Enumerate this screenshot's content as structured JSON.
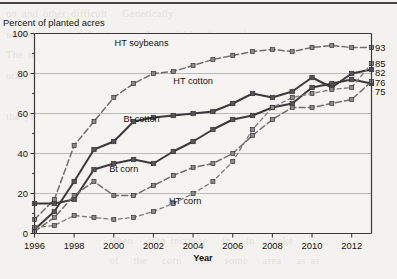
{
  "page": {
    "header_note": "Percent of planted acres"
  },
  "chart_data": {
    "type": "line",
    "title": "Percent of planted acres",
    "xlabel": "Year",
    "ylabel": "Percent of planted acres",
    "xlim": [
      1996,
      2013
    ],
    "ylim": [
      0,
      100
    ],
    "xticks": [
      1996,
      1998,
      2000,
      2002,
      2004,
      2006,
      2008,
      2010,
      2012
    ],
    "xtick_labels": [
      "1996",
      "1998",
      "2000",
      "2002",
      "2004",
      "2006",
      "2008",
      "2010",
      "2012"
    ],
    "yticks": [
      0,
      20,
      40,
      60,
      80,
      100
    ],
    "ytick_labels": [
      "0",
      "20",
      "40",
      "60",
      "80",
      "100"
    ],
    "yminor_ticks": [
      10,
      30,
      50,
      70,
      90
    ],
    "grid": "horizontal",
    "legend_position": "inline-annotations",
    "x": [
      1996,
      1997,
      1998,
      1999,
      2000,
      2001,
      2002,
      2003,
      2004,
      2005,
      2006,
      2007,
      2008,
      2009,
      2010,
      2011,
      2012,
      2013
    ],
    "series": [
      {
        "name": "HT soybeans",
        "label": "HT soybeans",
        "end_label": "93",
        "end_value": 93,
        "style": "dashed",
        "values": [
          7,
          17,
          44,
          56,
          68,
          75,
          80,
          81,
          84,
          87,
          89,
          91,
          92,
          91,
          93,
          94,
          93,
          93
        ]
      },
      {
        "name": "HT cotton",
        "label": "HT cotton",
        "end_label": "82",
        "end_value": 82,
        "style": "solid",
        "values": [
          2,
          11,
          26,
          42,
          46,
          56,
          58,
          59,
          60,
          61,
          65,
          70,
          68,
          71,
          78,
          73,
          80,
          82
        ]
      },
      {
        "name": "Bt cotton",
        "label": "Bt cotton",
        "end_label": "75",
        "end_value": 75,
        "style": "solid",
        "values": [
          15,
          15,
          17,
          32,
          35,
          37,
          35,
          41,
          46,
          52,
          57,
          59,
          63,
          65,
          73,
          75,
          77,
          75
        ]
      },
      {
        "name": "Bt corn",
        "label": "Bt corn",
        "end_label": "76",
        "end_value": 76,
        "style": "dashed",
        "values": [
          1,
          8,
          19,
          26,
          19,
          19,
          24,
          29,
          33,
          35,
          40,
          49,
          57,
          63,
          63,
          65,
          67,
          76
        ]
      },
      {
        "name": "HT corn",
        "label": "HT corn",
        "end_label": "85",
        "end_value": 85,
        "style": "dotted-dash",
        "values": [
          3,
          4,
          9,
          8,
          7,
          8,
          11,
          15,
          20,
          26,
          36,
          52,
          63,
          68,
          70,
          72,
          73,
          85
        ]
      }
    ],
    "annotations": [
      {
        "text": "HT soybeans",
        "x": 2001.4,
        "y": 94
      },
      {
        "text": "HT cotton",
        "x": 2004.0,
        "y": 75
      },
      {
        "text": "Bt cotton",
        "x": 2001.4,
        "y": 56
      },
      {
        "text": "Bt corn",
        "x": 2000.5,
        "y": 31
      },
      {
        "text": "HT corn",
        "x": 2003.6,
        "y": 15
      }
    ],
    "end_labels": [
      "93",
      "85",
      "82",
      "76",
      "75"
    ],
    "colors": {
      "solid_line": "#3a3a3a",
      "dashed_line": "#6e6e6e",
      "marker_fill": "#8a8a8a",
      "grid": "#a9a9a9",
      "axis": "#3a3a3a",
      "text": "#14130f",
      "background": "#f4f2ee"
    }
  },
  "bg_text": "on and other difficult   Genetically\nnotified crops difficult   poorly   yield   from   has\nThe most important   the industry has been in that of a major\nother   before   the plant   commercial   planting of\n\nthe yield with other   also that   Corn   in   the   2018 but   are\n\n\n\n                     seen traits actively   find for   the\n                     of the   of the   implanted   acres\n                     when   into increase   in   in   make\n                     of   the   corn   for   some   area   as as\n\n\nlot   feel 2   the   program   G   the   of   has   2   have   for"
}
